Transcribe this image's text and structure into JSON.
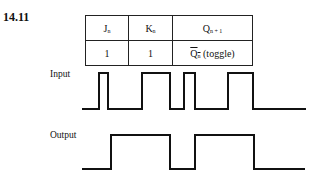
{
  "problem": {
    "number": "14.11"
  },
  "truth_table": {
    "headers": [
      {
        "main": "J",
        "sub": "n"
      },
      {
        "main": "K",
        "sub": "n"
      },
      {
        "main": "Q",
        "sub": "n + 1"
      }
    ],
    "rows": [
      {
        "j": "1",
        "k": "1",
        "q_main": "Q",
        "q_sub": "n",
        "q_note": " (toggle)"
      }
    ]
  },
  "waveforms": {
    "input": {
      "label": "Input",
      "high_y": 73,
      "low_y": 109,
      "points": "82,109 99,109 99,73 108,73 108,109 142,109 142,73 170,73 170,109 184,109 184,73 195,73 195,109 228,109 228,73 253,73 253,109 306,109"
    },
    "output": {
      "label": "Output",
      "high_y": 135,
      "low_y": 169,
      "points": "82,169 111,169 111,135 170,135 170,169 195,169 195,135 254,135 254,169 305,169"
    }
  }
}
